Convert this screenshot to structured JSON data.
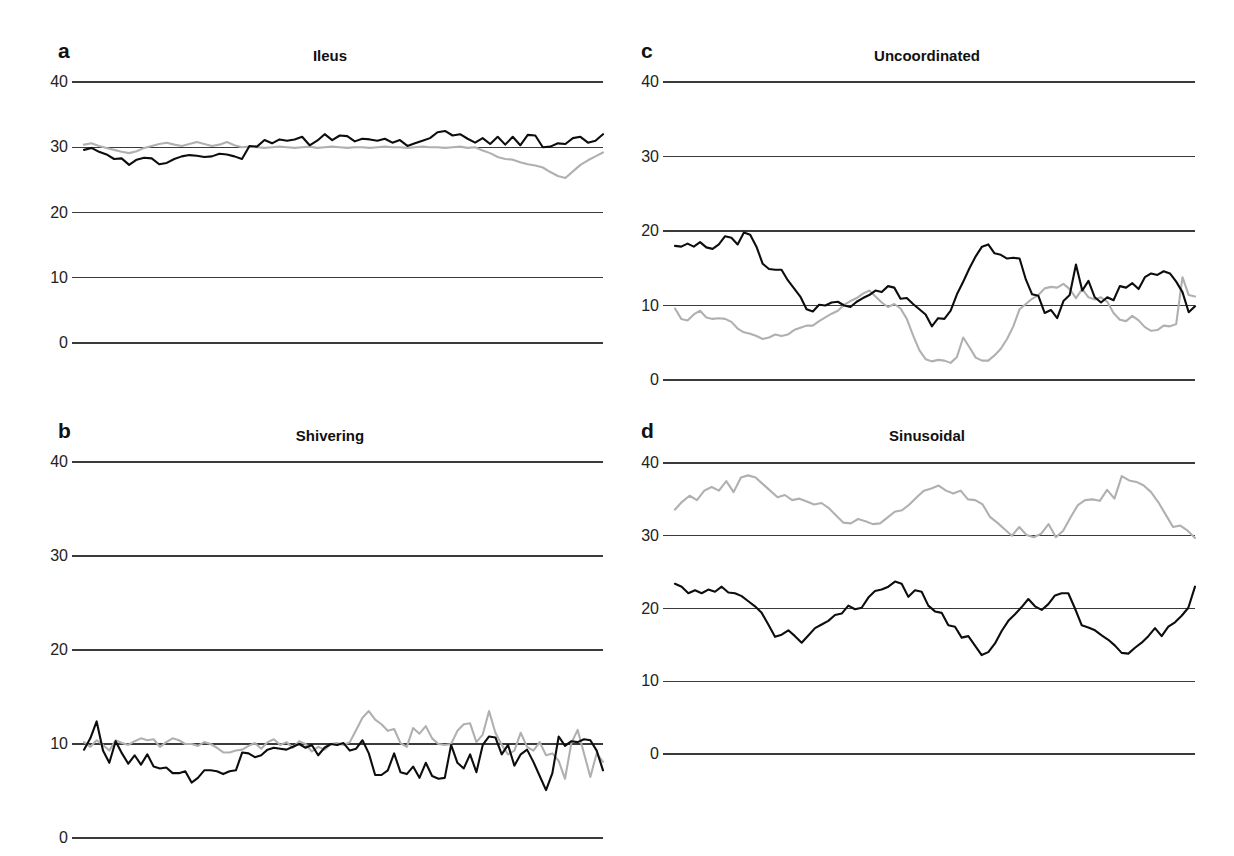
{
  "figure": {
    "panel_count": 4,
    "background": "#ffffff",
    "colors": {
      "series_dark": "#0d0d0d",
      "series_gray": "#b0b0b0",
      "gridline": "#3a3a3a",
      "text": "#111111"
    }
  },
  "chart_data": [
    {
      "type": "line",
      "panel_letter": "a",
      "title": "Ileus",
      "xlabel": "",
      "ylabel": "",
      "ylim": [
        0,
        40
      ],
      "yticks": [
        0,
        10,
        20,
        30,
        40
      ],
      "ytick_labels": [
        "0",
        "10",
        "20",
        "30",
        "40"
      ],
      "grid": true,
      "legend": "none",
      "series": [
        {
          "name": "dark",
          "color": "#0d0d0d",
          "values": [
            29.6,
            29.9,
            29.3,
            28.9,
            28.2,
            28.3,
            27.3,
            28.1,
            28.4,
            28.3,
            27.4,
            27.6,
            28.2,
            28.6,
            28.8,
            28.7,
            28.5,
            28.6,
            29.0,
            28.9,
            28.6,
            28.2,
            30.2,
            30.1,
            31.1,
            30.6,
            31.2,
            31.0,
            31.2,
            31.6,
            30.3,
            31.0,
            32.0,
            31.1,
            31.8,
            31.7,
            30.9,
            31.3,
            31.2,
            31.0,
            31.3,
            30.7,
            31.1,
            30.2,
            30.6,
            31.0,
            31.4,
            32.3,
            32.5,
            31.8,
            32.0,
            31.3,
            30.7,
            31.4,
            30.5,
            31.6,
            30.4,
            31.6,
            30.3,
            31.9,
            31.8,
            30.0,
            30.1,
            30.6,
            30.5,
            31.4,
            31.6,
            30.7,
            31.0,
            32.0
          ]
        },
        {
          "name": "gray",
          "color": "#b0b0b0",
          "values": [
            30.4,
            30.6,
            30.2,
            29.9,
            29.6,
            29.3,
            29.1,
            29.4,
            29.9,
            30.2,
            30.5,
            30.7,
            30.4,
            30.2,
            30.5,
            30.8,
            30.5,
            30.2,
            30.4,
            30.8,
            30.3,
            30.0,
            30.1,
            30.0,
            29.9,
            30.0,
            30.1,
            30.0,
            29.9,
            30.0,
            30.1,
            29.9,
            30.0,
            30.1,
            30.0,
            29.9,
            30.0,
            30.0,
            29.9,
            30.0,
            30.1,
            30.0,
            30.0,
            29.9,
            30.0,
            30.1,
            30.0,
            30.0,
            29.9,
            30.0,
            30.1,
            29.9,
            30.0,
            29.5,
            29.1,
            28.5,
            28.2,
            28.1,
            27.7,
            27.4,
            27.2,
            26.9,
            26.2,
            25.6,
            25.3,
            26.3,
            27.3,
            28.0,
            28.6,
            29.2
          ]
        }
      ]
    },
    {
      "type": "line",
      "panel_letter": "b",
      "title": "Shivering",
      "xlabel": "",
      "ylabel": "",
      "ylim": [
        0,
        40
      ],
      "yticks": [
        0,
        10,
        20,
        30,
        40
      ],
      "ytick_labels": [
        "0",
        "10",
        "20",
        "30",
        "40"
      ],
      "grid": true,
      "legend": "none",
      "series": [
        {
          "name": "dark",
          "color": "#0d0d0d",
          "values": [
            9.4,
            10.6,
            12.4,
            9.3,
            8.0,
            10.3,
            9.0,
            7.9,
            8.8,
            7.8,
            8.9,
            7.6,
            7.4,
            7.5,
            6.9,
            6.9,
            7.1,
            5.9,
            6.4,
            7.2,
            7.2,
            7.1,
            6.8,
            7.1,
            7.2,
            9.1,
            9.0,
            8.6,
            8.8,
            9.4,
            9.6,
            9.5,
            9.4,
            9.7,
            10.0,
            9.6,
            9.9,
            8.8,
            9.6,
            10.0,
            9.9,
            10.1,
            9.3,
            9.5,
            10.4,
            9.0,
            6.7,
            6.7,
            7.2,
            9.0,
            7.0,
            6.8,
            7.6,
            6.4,
            8.0,
            6.6,
            6.3,
            6.4,
            9.9,
            8.0,
            7.4,
            8.9,
            7.0,
            9.9,
            10.8,
            10.7,
            8.9,
            9.9,
            7.7,
            8.9,
            9.4,
            8.1,
            6.6,
            5.1,
            6.9,
            10.8,
            9.8,
            10.3,
            10.2,
            10.5,
            10.4,
            9.3,
            7.2
          ]
        },
        {
          "name": "gray",
          "color": "#b0b0b0",
          "values": [
            10.2,
            9.7,
            10.4,
            9.9,
            9.3,
            10.4,
            10.1,
            9.9,
            10.3,
            10.6,
            10.4,
            10.5,
            9.7,
            10.2,
            10.6,
            10.4,
            10.0,
            10.0,
            9.8,
            10.2,
            10.0,
            9.6,
            9.1,
            9.1,
            9.3,
            9.4,
            9.8,
            10.1,
            9.5,
            10.2,
            10.5,
            9.9,
            10.2,
            9.6,
            10.3,
            10.0,
            9.2,
            9.7,
            9.4,
            10.0,
            10.1,
            9.9,
            10.2,
            11.5,
            12.8,
            13.5,
            12.6,
            12.1,
            11.4,
            11.6,
            10.1,
            9.7,
            11.7,
            11.1,
            11.9,
            10.6,
            10.0,
            9.9,
            10.0,
            11.4,
            12.1,
            12.2,
            10.2,
            11.0,
            13.5,
            11.2,
            9.9,
            8.9,
            9.3,
            11.2,
            9.7,
            9.3,
            10.2,
            8.8,
            9.0,
            8.2,
            6.3,
            10.1,
            11.5,
            9.0,
            6.5,
            9.0,
            8.1
          ]
        }
      ]
    },
    {
      "type": "line",
      "panel_letter": "c",
      "title": "Uncoordinated",
      "xlabel": "",
      "ylabel": "",
      "ylim": [
        0,
        40
      ],
      "yticks": [
        0,
        10,
        20,
        30,
        40
      ],
      "ytick_labels": [
        "0",
        "10",
        "20",
        "30",
        "40"
      ],
      "grid": true,
      "legend": "none",
      "series": [
        {
          "name": "dark",
          "color": "#0d0d0d",
          "values": [
            18.0,
            17.9,
            18.3,
            17.9,
            18.5,
            17.8,
            17.6,
            18.2,
            19.3,
            19.1,
            18.2,
            19.8,
            19.5,
            17.9,
            15.6,
            14.9,
            14.8,
            14.8,
            13.4,
            12.3,
            11.2,
            9.5,
            9.2,
            10.1,
            10.0,
            10.4,
            10.5,
            10.0,
            9.8,
            10.5,
            11.0,
            11.4,
            12.0,
            11.8,
            12.6,
            12.4,
            10.9,
            11.0,
            10.2,
            9.5,
            8.8,
            7.2,
            8.3,
            8.2,
            9.3,
            11.5,
            13.2,
            15.0,
            16.6,
            17.9,
            18.2,
            17.0,
            16.8,
            16.3,
            16.4,
            16.3,
            13.5,
            11.5,
            11.3,
            9.0,
            9.4,
            8.3,
            10.6,
            11.4,
            15.5,
            12.0,
            13.3,
            11.1,
            10.4,
            11.1,
            10.7,
            12.6,
            12.4,
            13.0,
            12.2,
            13.8,
            14.3,
            14.1,
            14.6,
            14.3,
            13.2,
            11.8,
            9.1,
            9.9
          ]
        },
        {
          "name": "gray",
          "color": "#b0b0b0",
          "values": [
            9.6,
            8.2,
            8.0,
            8.8,
            9.3,
            8.4,
            8.2,
            8.3,
            8.2,
            7.8,
            6.9,
            6.4,
            6.2,
            5.9,
            5.5,
            5.7,
            6.1,
            5.9,
            6.1,
            6.7,
            7.0,
            7.3,
            7.3,
            7.9,
            8.4,
            8.9,
            9.3,
            10.1,
            10.6,
            11.0,
            11.6,
            12.0,
            11.2,
            10.4,
            9.8,
            10.2,
            9.6,
            8.2,
            6.0,
            4.0,
            2.8,
            2.5,
            2.7,
            2.6,
            2.3,
            3.1,
            5.7,
            4.4,
            3.0,
            2.6,
            2.6,
            3.3,
            4.2,
            5.5,
            7.2,
            9.5,
            10.2,
            10.9,
            11.4,
            12.3,
            12.5,
            12.4,
            12.9,
            12.2,
            11.0,
            12.2,
            11.1,
            10.8,
            11.1,
            10.5,
            9.0,
            8.1,
            7.9,
            8.6,
            8.0,
            7.1,
            6.6,
            6.7,
            7.3,
            7.2,
            7.5,
            13.8,
            11.4,
            11.2
          ]
        }
      ]
    },
    {
      "type": "line",
      "panel_letter": "d",
      "title": "Sinusoidal",
      "xlabel": "",
      "ylabel": "",
      "ylim": [
        0,
        40
      ],
      "yticks": [
        0,
        10,
        20,
        30,
        40
      ],
      "ytick_labels": [
        "0",
        "10",
        "20",
        "30",
        "40"
      ],
      "grid": true,
      "legend": "none",
      "series": [
        {
          "name": "dark",
          "color": "#0d0d0d",
          "values": [
            23.4,
            23.0,
            22.1,
            22.5,
            22.1,
            22.6,
            22.3,
            23.0,
            22.2,
            22.1,
            21.7,
            21.0,
            20.3,
            19.4,
            17.8,
            16.1,
            16.4,
            17.0,
            16.2,
            15.3,
            16.3,
            17.3,
            17.8,
            18.3,
            19.1,
            19.3,
            20.4,
            19.9,
            20.1,
            21.5,
            22.4,
            22.6,
            23.0,
            23.7,
            23.4,
            21.6,
            22.5,
            22.3,
            20.4,
            19.6,
            19.4,
            17.7,
            17.5,
            16.0,
            16.2,
            14.9,
            13.6,
            14.0,
            15.2,
            16.9,
            18.3,
            19.2,
            20.2,
            21.3,
            20.3,
            19.8,
            20.6,
            21.8,
            22.1,
            22.1,
            20.0,
            17.7,
            17.4,
            17.0,
            16.3,
            15.7,
            14.9,
            13.9,
            13.8,
            14.6,
            15.3,
            16.2,
            17.3,
            16.2,
            17.5,
            18.1,
            19.0,
            20.1,
            23.0
          ]
        },
        {
          "name": "gray",
          "color": "#b0b0b0",
          "values": [
            33.6,
            34.7,
            35.5,
            34.9,
            36.2,
            36.7,
            36.2,
            37.5,
            36.0,
            38.0,
            38.3,
            38.0,
            37.1,
            36.2,
            35.3,
            35.6,
            34.9,
            35.1,
            34.7,
            34.3,
            34.5,
            33.8,
            32.8,
            31.8,
            31.7,
            32.3,
            32.0,
            31.6,
            31.7,
            32.5,
            33.3,
            33.5,
            34.3,
            35.3,
            36.2,
            36.5,
            36.9,
            36.2,
            35.8,
            36.2,
            35.0,
            34.9,
            34.3,
            32.6,
            31.8,
            30.9,
            30.0,
            31.2,
            30.1,
            29.8,
            30.3,
            31.6,
            29.8,
            30.7,
            32.5,
            34.2,
            34.9,
            35.0,
            34.8,
            36.3,
            35.1,
            38.2,
            37.6,
            37.4,
            36.9,
            36.0,
            34.6,
            32.9,
            31.2,
            31.4,
            30.7,
            29.7
          ]
        }
      ]
    }
  ]
}
